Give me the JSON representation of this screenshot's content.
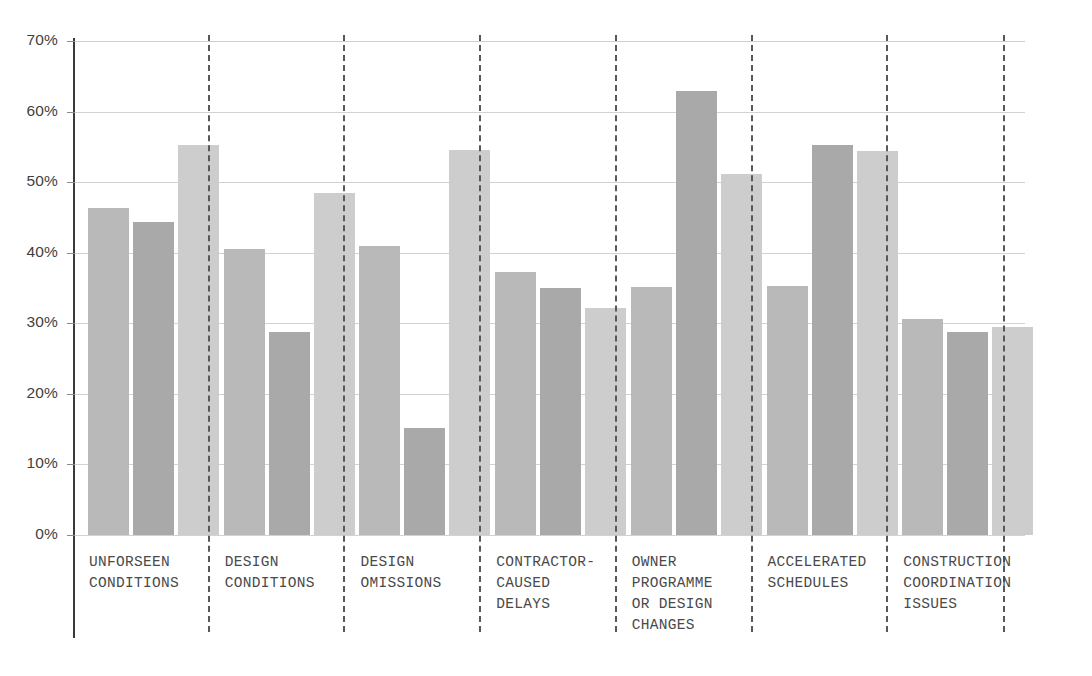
{
  "chart_data": {
    "type": "bar",
    "title": "",
    "subtitle": "",
    "xlabel": "",
    "ylabel": "",
    "ylim": [
      0,
      70
    ],
    "y_unit": "%",
    "grid": true,
    "legend_position": "none",
    "categories": [
      "UNFORSEEN\nCONDITIONS",
      "DESIGN\nCONDITIONS",
      "DESIGN\nOMISSIONS",
      "CONTRACTOR-\nCAUSED\nDELAYS",
      "OWNER\nPROGRAMME\nOR DESIGN\nCHANGES",
      "ACCELERATED\nSCHEDULES",
      "CONSTRUCTION\nCOORDINATION\nISSUES"
    ],
    "ytick_labels": [
      "70%",
      "60%",
      "50%",
      "40%",
      "30%",
      "20%",
      "10%",
      "0%"
    ],
    "ytick_values": [
      70,
      60,
      50,
      40,
      30,
      20,
      10,
      0
    ],
    "series": [
      {
        "name": "Series 1",
        "color": "#b9b9b9",
        "values": [
          46.4,
          40.5,
          40.9,
          37.2,
          35.1,
          35.3,
          30.6
        ]
      },
      {
        "name": "Series 2",
        "color": "#a9a9a9",
        "values": [
          44.3,
          28.7,
          15.2,
          35.0,
          62.9,
          55.2,
          28.8
        ]
      },
      {
        "name": "Series 3",
        "color": "#cdcdcd",
        "values": [
          55.2,
          48.5,
          54.6,
          32.1,
          51.2,
          54.4,
          29.5
        ]
      }
    ]
  },
  "colors": {
    "series_1": "#b9b9b9",
    "series_2": "#a9a9a9",
    "series_3": "#cdcdcd",
    "gridline": "#d2d2d2",
    "axis": "#3a3a3a",
    "separator": "#55595e",
    "tick_text": "#3f3f3f",
    "category_text": "#4a4a4a",
    "background": "#ffffff"
  }
}
